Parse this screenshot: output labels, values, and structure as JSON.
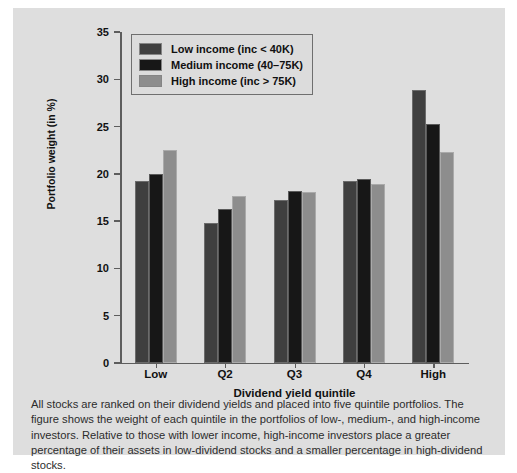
{
  "chart_data": {
    "type": "bar",
    "title": "",
    "xlabel": "Dividend yield quintile",
    "ylabel": "Portfolio weight (in %)",
    "ylim": [
      0,
      35
    ],
    "yticks": [
      0,
      5,
      10,
      15,
      20,
      25,
      30,
      35
    ],
    "ytick_labels": [
      "0",
      "5",
      "10",
      "15",
      "20",
      "25",
      "30",
      "35"
    ],
    "grid": false,
    "legend_position": "top-left",
    "categories": [
      "Low",
      "Q2",
      "Q3",
      "Q4",
      "High"
    ],
    "series": [
      {
        "name": "Low income (inc < 40K)",
        "color": "#3f3f3f",
        "values": [
          19.2,
          14.8,
          17.2,
          19.2,
          28.9
        ]
      },
      {
        "name": "Medium income (40–75K)",
        "color": "#171717",
        "values": [
          20.0,
          16.3,
          18.2,
          19.5,
          25.3
        ]
      },
      {
        "name": "High income (inc > 75K)",
        "color": "#8d8d8d",
        "values": [
          22.5,
          17.7,
          18.1,
          18.9,
          22.3
        ]
      }
    ]
  },
  "caption": {
    "text": "All stocks are ranked on their dividend yields and placed into five quintile portfolios. The figure shows the weight of each quintile in the portfolios of low-, medium-, and high-income investors. Relative to those with lower income, high-income investors place a greater percentage of their assets in low-dividend stocks and a smaller percentage in high-dividend stocks."
  }
}
